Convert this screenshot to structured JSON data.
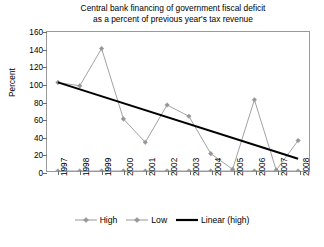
{
  "chart_data": {
    "type": "line",
    "title": "Central bank financing of government fiscal deficit as a percent of previous year's tax revenue",
    "title_line1": "Central bank financing of government fiscal deficit",
    "title_line2": "as a percent of previous year's tax revenue",
    "xlabel": "",
    "ylabel": "Percent",
    "ylim": [
      0,
      160
    ],
    "ytick_step": 20,
    "yticks": [
      0,
      20,
      40,
      60,
      80,
      100,
      120,
      140,
      160
    ],
    "grid": false,
    "legend_position": "bottom",
    "categories": [
      "1997",
      "1998",
      "1999",
      "2000",
      "2001",
      "2002",
      "2003",
      "2004",
      "2005",
      "2006",
      "2007",
      "2008"
    ],
    "series": [
      {
        "name": "High",
        "type": "line",
        "color": "#969696",
        "marker": "diamond",
        "values": [
          102,
          98,
          141,
          60,
          33,
          76,
          63,
          20,
          2,
          82,
          1,
          35
        ]
      },
      {
        "name": "Low",
        "type": "line",
        "color": "#969696",
        "marker": "diamond",
        "values": [
          0,
          0,
          0,
          0,
          0,
          0,
          0,
          0,
          0,
          0,
          0,
          0
        ]
      },
      {
        "name": "Linear (high)",
        "type": "trendline",
        "color": "#000000",
        "marker": "none",
        "endpoints": [
          102,
          14
        ],
        "values": [
          102,
          94,
          86,
          78,
          70,
          62,
          54,
          46,
          38,
          30,
          22,
          14
        ]
      }
    ]
  },
  "legend": {
    "items": [
      {
        "label": "High",
        "color": "#969696",
        "style": "line-marker"
      },
      {
        "label": "Low",
        "color": "#969696",
        "style": "line-marker"
      },
      {
        "label": "Linear (high)",
        "color": "#000000",
        "style": "line-thick"
      }
    ]
  },
  "axis": {
    "y_title": "Percent"
  }
}
